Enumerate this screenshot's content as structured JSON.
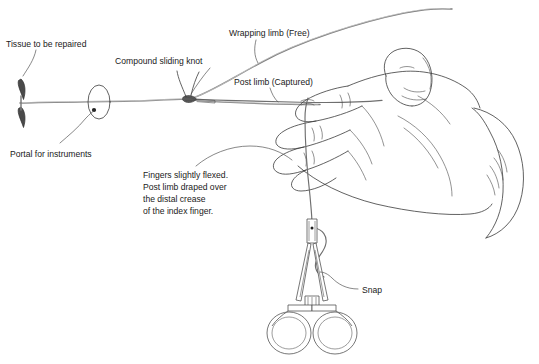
{
  "figure": {
    "background_color": "#ffffff",
    "ink_color": "#3a3a3a",
    "suture_color": "#7d7d7d",
    "tissue_color": "#4a4a4a",
    "width": 539,
    "height": 364
  },
  "labels": {
    "tissue": "Tissue to be repaired",
    "knot": "Compound sliding knot",
    "wrapping_limb": "Wrapping limb (Free)",
    "post_limb": "Post limb (Captured)",
    "portal": "Portal for instruments",
    "snap": "Snap",
    "fingers_note": {
      "line1": "Fingers slightly flexed.",
      "line2": "Post limb draped over",
      "line3": "the distal crease",
      "line4": "of the index finger."
    }
  },
  "elements": {
    "tissue_icon": "tissue-edges",
    "portal_icon": "portal-ellipse",
    "knot_icon": "knot-cluster",
    "hand_icon": "hand-palm-down",
    "snap_icon": "hemostat-clamp"
  }
}
